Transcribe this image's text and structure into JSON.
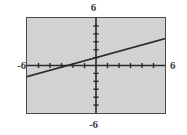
{
  "graph": {
    "top_label": "6",
    "bottom_label": "-6",
    "left_label": "-6",
    "right_label": "6"
  },
  "chart_data": {
    "type": "line",
    "title": "",
    "xlabel": "",
    "ylabel": "",
    "xlim": [
      -6,
      6
    ],
    "ylim": [
      -6,
      6
    ],
    "grid": false,
    "legend": null,
    "axes": {
      "x_axis_y": 0,
      "y_axis_x": 0,
      "x_tick_step": 1,
      "y_tick_step": 1,
      "x_ticks": [
        -5,
        -4,
        -3,
        -2,
        -1,
        1,
        2,
        3,
        4,
        5
      ],
      "y_ticks": [
        -5,
        -4,
        -3,
        -2,
        -1,
        1,
        2,
        3,
        4,
        5
      ],
      "tick_labels_shown": false
    },
    "series": [
      {
        "name": "line",
        "equation": "y = 0.4x + 1",
        "slope": 0.4,
        "intercept": 1,
        "x_intercept": -2.5,
        "color": "#2b2b2b",
        "x": [
          -6,
          6
        ],
        "values": [
          -1.4,
          3.4
        ]
      }
    ],
    "window_labels": {
      "ymax": "6",
      "ymin": "-6",
      "xmin": "-6",
      "xmax": "6"
    },
    "colors": {
      "plot_background": "#d2d2d2",
      "page_background": "#ffffff",
      "axis": "#2b2b2b",
      "border": "#4a4a4a",
      "label_text": "#3a3a3a",
      "curve": "#2b2b2b"
    }
  }
}
